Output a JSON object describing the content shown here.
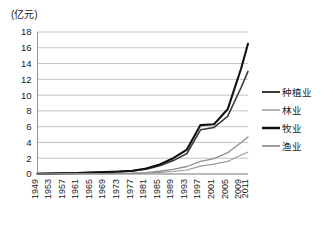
{
  "chart_data": {
    "type": "line",
    "title": "",
    "unit_label": "(亿元)",
    "xlabel": "",
    "ylabel": "",
    "ylim": [
      0,
      18
    ],
    "ytick_step": 2,
    "yticks": [
      18,
      16,
      14,
      12,
      10,
      8,
      6,
      4,
      2,
      0
    ],
    "grid": true,
    "legend_position": "right",
    "x": [
      1949,
      1953,
      1957,
      1961,
      1965,
      1969,
      1973,
      1977,
      1981,
      1985,
      1989,
      1993,
      1997,
      2001,
      2005,
      2009,
      2011
    ],
    "xtick_labels": [
      "1949",
      "1953",
      "1957",
      "1961",
      "1965",
      "1969",
      "1973",
      "1977",
      "1981",
      "1985",
      "1989",
      "1993",
      "1997",
      "2001",
      "2005",
      "2009",
      "2011"
    ],
    "series": [
      {
        "name": "种植业",
        "color": "#3a3a3a",
        "width": 1.6,
        "values": [
          0.05,
          0.08,
          0.12,
          0.14,
          0.2,
          0.25,
          0.32,
          0.4,
          0.62,
          1.05,
          1.7,
          2.6,
          5.6,
          5.9,
          7.3,
          11.0,
          13.0
        ]
      },
      {
        "name": "林业",
        "color": "#9a9a9a",
        "width": 1.1,
        "values": [
          0.01,
          0.02,
          0.02,
          0.03,
          0.04,
          0.05,
          0.06,
          0.08,
          0.12,
          0.2,
          0.32,
          0.5,
          1.0,
          1.25,
          1.6,
          2.4,
          2.8
        ]
      },
      {
        "name": "牧业",
        "color": "#111111",
        "width": 2.1,
        "values": [
          0.04,
          0.07,
          0.1,
          0.12,
          0.18,
          0.24,
          0.3,
          0.42,
          0.7,
          1.2,
          2.0,
          3.1,
          6.2,
          6.3,
          8.2,
          13.4,
          16.5
        ]
      },
      {
        "name": "渔业",
        "color": "#8e8e8e",
        "width": 1.3,
        "values": [
          0.01,
          0.02,
          0.03,
          0.03,
          0.05,
          0.06,
          0.08,
          0.1,
          0.18,
          0.35,
          0.6,
          0.95,
          1.6,
          1.95,
          2.7,
          4.0,
          4.7
        ]
      }
    ]
  },
  "legend": {
    "items": [
      {
        "label": "种植业"
      },
      {
        "label": "林业"
      },
      {
        "label": "牧业"
      },
      {
        "label": "渔业"
      }
    ]
  }
}
